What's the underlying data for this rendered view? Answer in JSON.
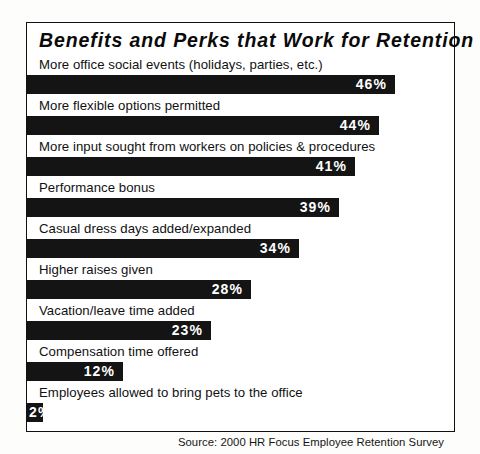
{
  "chart_data": {
    "type": "bar",
    "orientation": "horizontal",
    "title": "Benefits and Perks that Work for Retention",
    "xlabel": "",
    "ylabel": "",
    "xlim": [
      0,
      50
    ],
    "grid": false,
    "legend": null,
    "value_suffix": "%",
    "px_per_percent": 8,
    "source_note": "Source: 2000 HR Focus Employee Retention Survey",
    "categories": [
      "More office social events (holidays, parties, etc.)",
      "More flexible options permitted",
      "More input sought from workers on policies & procedures",
      "Performance bonus",
      "Casual dress days added/expanded",
      "Higher raises given",
      "Vacation/leave time added",
      "Compensation time offered",
      "Employees allowed to bring pets to the office"
    ],
    "values": [
      46,
      44,
      41,
      39,
      34,
      28,
      23,
      12,
      2
    ],
    "value_labels": [
      "46%",
      "44%",
      "41%",
      "39%",
      "34%",
      "28%",
      "23%",
      "12%",
      "2%"
    ],
    "bars": [
      {
        "label": "More office social events (holidays, parties, etc.)",
        "value": 46,
        "value_label": "46%",
        "label_placement": "inside"
      },
      {
        "label": "More flexible options permitted",
        "value": 44,
        "value_label": "44%",
        "label_placement": "inside"
      },
      {
        "label": "More input sought from workers on policies & procedures",
        "value": 41,
        "value_label": "41%",
        "label_placement": "inside"
      },
      {
        "label": "Performance bonus",
        "value": 39,
        "value_label": "39%",
        "label_placement": "inside"
      },
      {
        "label": "Casual dress days added/expanded",
        "value": 34,
        "value_label": "34%",
        "label_placement": "inside"
      },
      {
        "label": "Higher raises given",
        "value": 28,
        "value_label": "28%",
        "label_placement": "inside"
      },
      {
        "label": "Vacation/leave time added",
        "value": 23,
        "value_label": "23%",
        "label_placement": "inside"
      },
      {
        "label": "Compensation time offered",
        "value": 12,
        "value_label": "12%",
        "label_placement": "inside"
      },
      {
        "label": "Employees allowed to bring pets to the office",
        "value": 2,
        "value_label": "2%",
        "label_placement": "overflow"
      }
    ],
    "colors": {
      "bar": "#141414",
      "value_text": "#ffffff",
      "label_text": "#111111",
      "background": "#ffffff",
      "border": "#111111",
      "page_background": "#fdfdfb"
    }
  }
}
